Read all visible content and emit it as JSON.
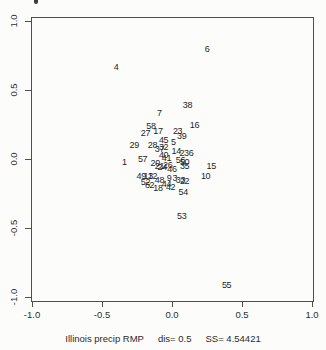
{
  "figure": {
    "background": "#fcfcfb",
    "caption": {
      "dataset": "Illinois precip RMP",
      "dis": "dis= 0.5",
      "ss": "SS= 4.54421"
    }
  },
  "chart_data": {
    "type": "scatter",
    "title": "",
    "xlabel": "Illinois precip RMP   dis= 0.5   SS= 4.54421",
    "ylabel": "",
    "xlim": [
      -1.0,
      1.0
    ],
    "ylim": [
      -1.0,
      1.0
    ],
    "grid": false,
    "legend": "none",
    "marker_style": "numeric-text-labels",
    "xticks": [
      {
        "value": -1.0,
        "label": "-1.0"
      },
      {
        "value": -0.5,
        "label": "-0.5"
      },
      {
        "value": 0.0,
        "label": "0.0"
      },
      {
        "value": 0.5,
        "label": "0.5"
      },
      {
        "value": 1.0,
        "label": "1.0"
      }
    ],
    "yticks": [
      {
        "value": 1.0,
        "label": "1.0"
      },
      {
        "value": 0.5,
        "label": "0.5"
      },
      {
        "value": 0.0,
        "label": "0.0"
      },
      {
        "value": -0.5,
        "label": "-0.5"
      },
      {
        "value": -1.0,
        "label": "-1.0"
      }
    ],
    "points": [
      {
        "label": "6",
        "x": 0.25,
        "y": 0.8
      },
      {
        "label": "4",
        "x": -0.4,
        "y": 0.67
      },
      {
        "label": "38",
        "x": 0.11,
        "y": 0.39
      },
      {
        "label": "7",
        "x": -0.09,
        "y": 0.33
      },
      {
        "label": "16",
        "x": 0.16,
        "y": 0.25
      },
      {
        "label": "58",
        "x": -0.15,
        "y": 0.24
      },
      {
        "label": "17",
        "x": -0.1,
        "y": 0.2
      },
      {
        "label": "27",
        "x": -0.19,
        "y": 0.19
      },
      {
        "label": "23",
        "x": 0.04,
        "y": 0.2
      },
      {
        "label": "39",
        "x": 0.07,
        "y": 0.17
      },
      {
        "label": "45",
        "x": -0.06,
        "y": 0.14
      },
      {
        "label": "5",
        "x": 0.01,
        "y": 0.12
      },
      {
        "label": "29",
        "x": -0.27,
        "y": 0.1
      },
      {
        "label": "28",
        "x": -0.14,
        "y": 0.1
      },
      {
        "label": "32",
        "x": -0.06,
        "y": 0.09
      },
      {
        "label": "37",
        "x": -0.09,
        "y": 0.07
      },
      {
        "label": "14",
        "x": 0.03,
        "y": 0.06
      },
      {
        "label": "2",
        "x": 0.07,
        "y": 0.04
      },
      {
        "label": "36",
        "x": 0.12,
        "y": 0.04
      },
      {
        "label": "40",
        "x": -0.06,
        "y": 0.03
      },
      {
        "label": "41",
        "x": -0.04,
        "y": 0.01
      },
      {
        "label": "57",
        "x": -0.21,
        "y": 0.0
      },
      {
        "label": "56",
        "x": 0.06,
        "y": -0.01
      },
      {
        "label": "50",
        "x": 0.09,
        "y": -0.02
      },
      {
        "label": "1",
        "x": -0.34,
        "y": -0.02
      },
      {
        "label": "20",
        "x": -0.12,
        "y": -0.03
      },
      {
        "label": "26",
        "x": -0.03,
        "y": -0.04
      },
      {
        "label": "21",
        "x": -0.09,
        "y": -0.05
      },
      {
        "label": "24",
        "x": -0.07,
        "y": -0.06
      },
      {
        "label": "35",
        "x": 0.09,
        "y": -0.05
      },
      {
        "label": "15",
        "x": 0.28,
        "y": -0.05
      },
      {
        "label": "46",
        "x": 0.0,
        "y": -0.07
      },
      {
        "label": "10",
        "x": 0.24,
        "y": -0.12
      },
      {
        "label": "49",
        "x": -0.22,
        "y": -0.12
      },
      {
        "label": "13",
        "x": -0.17,
        "y": -0.12
      },
      {
        "label": "12",
        "x": -0.14,
        "y": -0.12
      },
      {
        "label": "48",
        "x": -0.09,
        "y": -0.15
      },
      {
        "label": "9",
        "x": -0.02,
        "y": -0.14
      },
      {
        "label": "3",
        "x": 0.02,
        "y": -0.14
      },
      {
        "label": "33",
        "x": 0.06,
        "y": -0.15
      },
      {
        "label": "22",
        "x": 0.09,
        "y": -0.16
      },
      {
        "label": "52",
        "x": -0.19,
        "y": -0.17
      },
      {
        "label": "62",
        "x": -0.16,
        "y": -0.19
      },
      {
        "label": "44",
        "x": -0.04,
        "y": -0.18
      },
      {
        "label": "42",
        "x": -0.01,
        "y": -0.2
      },
      {
        "label": "18",
        "x": -0.1,
        "y": -0.21
      },
      {
        "label": "54",
        "x": 0.08,
        "y": -0.24
      },
      {
        "label": "53",
        "x": 0.07,
        "y": -0.41
      },
      {
        "label": "55",
        "x": 0.39,
        "y": -0.91
      }
    ]
  }
}
